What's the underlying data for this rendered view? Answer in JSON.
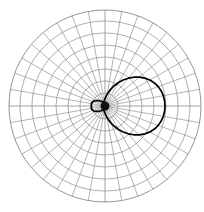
{
  "chart_data": {
    "type": "line",
    "plot_kind": "polar-radiation-pattern",
    "title": "",
    "subtitle": "",
    "xlabel": "",
    "ylabel": "",
    "legend": [],
    "annotations": [],
    "grid": {
      "visible": true,
      "rings": 8,
      "ring_radii_px": [
        13,
        25,
        37,
        49,
        61,
        73,
        85,
        96
      ],
      "spokes": 36,
      "spoke_step_deg": 10,
      "angle_ticks_deg": [
        0,
        10,
        20,
        30,
        40,
        50,
        60,
        70,
        80,
        90,
        100,
        110,
        120,
        130,
        140,
        150,
        160,
        170,
        180,
        190,
        200,
        210,
        220,
        230,
        240,
        250,
        260,
        270,
        280,
        290,
        300,
        310,
        320,
        330,
        340,
        350
      ],
      "radial_tick_labels": [],
      "angle_tick_labels": [],
      "grid_color": "#8a8a8a",
      "center_px": [
        105,
        106
      ],
      "outer_radius_px": 96
    },
    "curve_color": "#000000",
    "rlim": [
      0,
      1
    ],
    "theta_units": "degrees",
    "theta_zero_location": "E",
    "theta_direction": "counterclockwise",
    "series": [
      {
        "name": "radiation pattern",
        "theta_deg": [
          0,
          5,
          10,
          15,
          20,
          25,
          30,
          35,
          40,
          45,
          50,
          55,
          60,
          65,
          70,
          75,
          80,
          85,
          90,
          95,
          100,
          105,
          110,
          115,
          120,
          125,
          130,
          135,
          140,
          145,
          150,
          155,
          160,
          165,
          170,
          175,
          180,
          185,
          190,
          195,
          200,
          205,
          210,
          215,
          220,
          225,
          230,
          235,
          240,
          245,
          250,
          255,
          260,
          265,
          270,
          275,
          280,
          285,
          290,
          295,
          300,
          305,
          310,
          315,
          320,
          325,
          330,
          335,
          340,
          345,
          350,
          355,
          360
        ],
        "r": [
          0.625,
          0.623,
          0.617,
          0.606,
          0.59,
          0.568,
          0.54,
          0.506,
          0.467,
          0.424,
          0.378,
          0.33,
          0.282,
          0.236,
          0.193,
          0.155,
          0.122,
          0.096,
          0.076,
          0.062,
          0.053,
          0.048,
          0.046,
          0.047,
          0.05,
          0.056,
          0.064,
          0.074,
          0.086,
          0.099,
          0.112,
          0.124,
          0.134,
          0.141,
          0.144,
          0.144,
          0.142,
          0.144,
          0.144,
          0.141,
          0.134,
          0.124,
          0.112,
          0.099,
          0.086,
          0.074,
          0.064,
          0.056,
          0.05,
          0.047,
          0.046,
          0.048,
          0.053,
          0.062,
          0.076,
          0.096,
          0.122,
          0.155,
          0.193,
          0.236,
          0.282,
          0.33,
          0.378,
          0.424,
          0.467,
          0.506,
          0.54,
          0.568,
          0.59,
          0.606,
          0.617,
          0.623,
          0.625
        ]
      }
    ],
    "features": {
      "main_lobe_direction_deg": 0,
      "main_lobe_peak_r": 0.625,
      "back_lobe_direction_deg": 180,
      "back_lobe_peak_r": 0.145,
      "symmetry": "mirror about horizontal axis"
    }
  }
}
